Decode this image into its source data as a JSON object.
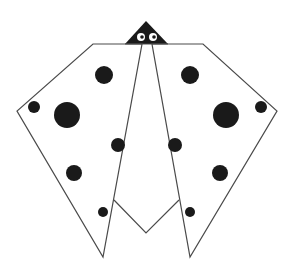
{
  "figure": {
    "colors": {
      "stroke": "#4a4a4a",
      "fill": "#ffffff",
      "spot": "#1a1a1a",
      "eye": "#ffffff"
    },
    "spots": [
      {
        "cx": 104,
        "cy": 75,
        "r": 9
      },
      {
        "cx": 34,
        "cy": 107,
        "r": 6
      },
      {
        "cx": 67,
        "cy": 115,
        "r": 13
      },
      {
        "cx": 118,
        "cy": 145,
        "r": 7
      },
      {
        "cx": 74,
        "cy": 173,
        "r": 8
      },
      {
        "cx": 103,
        "cy": 212,
        "r": 5
      },
      {
        "cx": 190,
        "cy": 75,
        "r": 9
      },
      {
        "cx": 261,
        "cy": 107,
        "r": 6
      },
      {
        "cx": 226,
        "cy": 115,
        "r": 13
      },
      {
        "cx": 175,
        "cy": 145,
        "r": 7
      },
      {
        "cx": 220,
        "cy": 173,
        "r": 8
      },
      {
        "cx": 190,
        "cy": 212,
        "r": 5
      }
    ]
  }
}
